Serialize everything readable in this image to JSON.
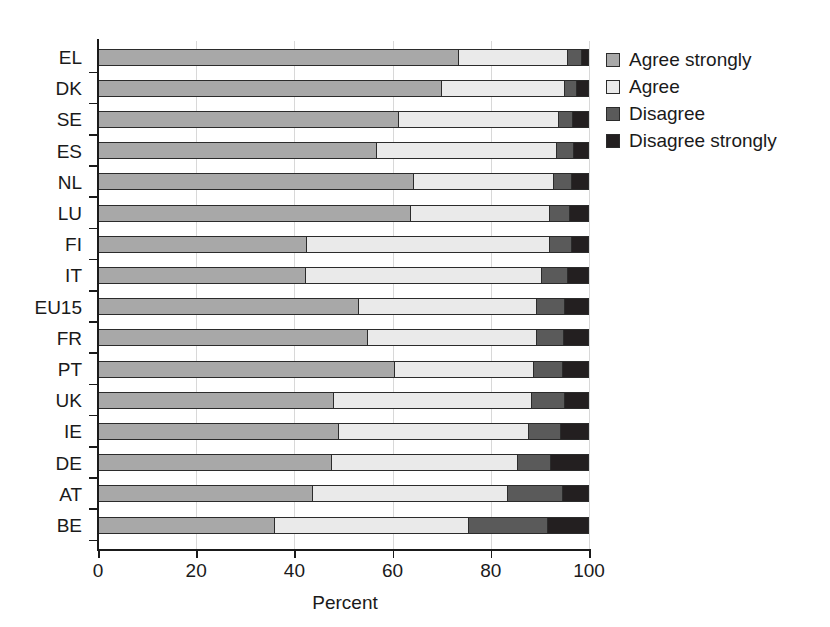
{
  "chart_data": {
    "type": "bar",
    "orientation": "horizontal",
    "stacked": true,
    "stack_total": 100,
    "title": "",
    "xlabel": "Percent",
    "ylabel": "",
    "xlim": [
      0,
      100
    ],
    "xticks": [
      0,
      20,
      40,
      60,
      80,
      100
    ],
    "xticklabels": [
      "0",
      "20",
      "40",
      "60",
      "80",
      "100"
    ],
    "grid": "vertical",
    "legend_position": "right",
    "categories": [
      "EL",
      "DK",
      "SE",
      "ES",
      "NL",
      "LU",
      "FI",
      "IT",
      "EU15",
      "FR",
      "PT",
      "UK",
      "IE",
      "DE",
      "AT",
      "BE"
    ],
    "series": [
      {
        "name": "Agree strongly",
        "color": "#a8a8a8",
        "values": [
          73.3,
          69.8,
          61.1,
          56.6,
          64.2,
          63.6,
          42.4,
          42.2,
          53.0,
          54.8,
          60.3,
          47.9,
          48.9,
          47.5,
          43.6,
          35.8
        ]
      },
      {
        "name": "Agree",
        "color": "#eaeaea",
        "values": [
          22.3,
          25.1,
          32.6,
          36.7,
          28.4,
          28.3,
          49.4,
          48.0,
          36.2,
          34.4,
          28.2,
          40.2,
          38.7,
          37.8,
          39.7,
          39.6
        ]
      },
      {
        "name": "Disagree",
        "color": "#5a5a5a",
        "values": [
          2.7,
          2.5,
          2.8,
          3.4,
          3.8,
          4.0,
          4.5,
          5.4,
          5.7,
          5.6,
          6.1,
          6.8,
          6.5,
          6.7,
          11.1,
          16.0
        ]
      },
      {
        "name": "Disagree strongly",
        "color": "#231f20",
        "values": [
          1.7,
          2.6,
          3.5,
          3.3,
          3.6,
          4.1,
          3.7,
          4.4,
          5.1,
          5.2,
          5.4,
          5.1,
          5.9,
          8.0,
          5.6,
          8.6
        ]
      }
    ]
  },
  "axis": {
    "x_title": "Percent"
  }
}
